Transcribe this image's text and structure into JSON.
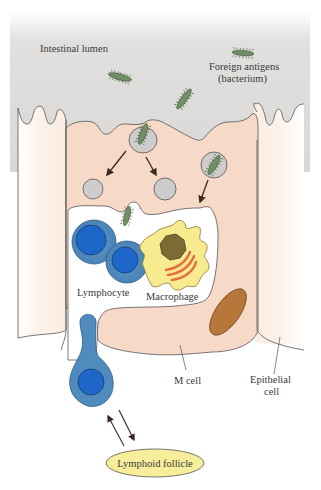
{
  "diagram": {
    "labels": {
      "lumen": "Intestinal lumen",
      "antigen_line1": "Foreign antigens",
      "antigen_line2": "(bacterium)",
      "lymphocyte": "Lymphocyte",
      "macrophage": "Macrophage",
      "m_cell": "M cell",
      "epithelial_line1": "Epithelial",
      "epithelial_line2": "cell",
      "follicle": "Lymphoid follicle"
    },
    "colors": {
      "lumen": "#d9d7d5",
      "m_cell": "#f7d9c8",
      "epithelial": "#fbeee4",
      "bacterium": "#6f8f64",
      "vesicle": "#cfcdcb",
      "lymphocyte_outer": "#4f8bbd",
      "lymphocyte_nucleus": "#1f66c9",
      "macrophage": "#f7ea8f",
      "macrophage_nucleus": "#7c6b35",
      "mitochondria": "#e56d3f",
      "granule": "#b8773a",
      "follicle": "#f6ee9a"
    }
  }
}
